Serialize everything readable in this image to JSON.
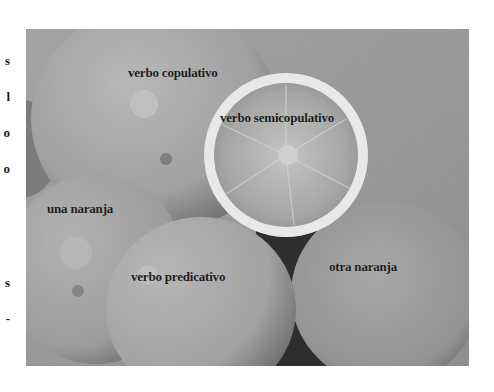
{
  "figure": {
    "type": "photo",
    "labels": [
      {
        "id": "verbo-copulativo",
        "text": "verbo copulativo"
      },
      {
        "id": "verbo-semicopulativo",
        "text": "verbo semicopulativo"
      },
      {
        "id": "una-naranja",
        "text": "una naranja"
      },
      {
        "id": "verbo-predicativo",
        "text": "verbo predicativo"
      },
      {
        "id": "otra-naranja",
        "text": "otra naranja"
      }
    ]
  },
  "edge_fragments": [
    "s",
    "l",
    "o",
    "o",
    "s",
    "-"
  ],
  "colors": {
    "background": "#9a9a9a",
    "orange_light": "#b4b4b4",
    "orange_mid": "#a2a2a2",
    "orange_dark": "#7a7a7a",
    "shadow": "#2e2e2e",
    "rind": "#e6e6e6",
    "text": "#1a1a1a"
  }
}
